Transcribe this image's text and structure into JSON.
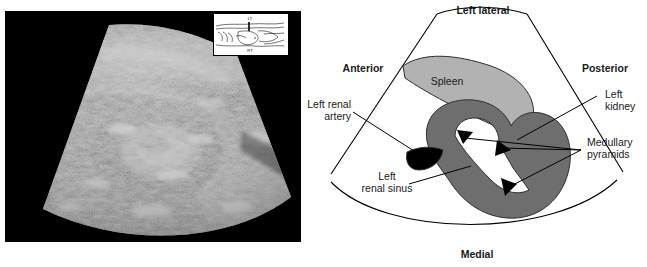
{
  "figure": {
    "panels": [
      {
        "id": "ultrasound",
        "kind": "ultrasound-image",
        "modality": "grayscale sector scan"
      },
      {
        "id": "diagram",
        "kind": "labeled-line-diagram"
      }
    ]
  },
  "ultrasound": {
    "background_color": "#000000",
    "orientation_inset": {
      "top_label": "LT",
      "bottom_label": "RT",
      "border_color": "#000000",
      "background_color": "#ffffff"
    }
  },
  "diagram": {
    "orientation_labels": {
      "top": "Left lateral",
      "left": "Anterior",
      "right": "Posterior",
      "bottom": "Medial"
    },
    "structures": [
      {
        "name": "Spleen",
        "label": "Spleen",
        "color": "#b2b2b2"
      },
      {
        "name": "Left kidney",
        "label_line_1": "Left",
        "label_line_2": "kidney",
        "color": "#6e6e6e"
      },
      {
        "name": "Left renal artery",
        "label_line_1": "Left renal",
        "label_line_2": "artery",
        "color": "#000000"
      },
      {
        "name": "Left renal sinus",
        "label_line_1": "Left",
        "label_line_2": "renal sinus",
        "color": "#ffffff"
      },
      {
        "name": "Medullary pyramids",
        "label_line_1": "Medullary",
        "label_line_2": "pyramids",
        "color": "#000000"
      }
    ],
    "outline_color": "#000000",
    "text_color": "#1a1a1a"
  }
}
